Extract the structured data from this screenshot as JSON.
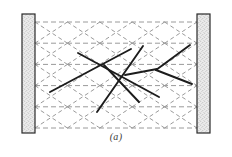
{
  "figure": {
    "caption": "(a)",
    "kind": "structural-frame-strut-and-tie-diagram",
    "background_color": "#ffffff"
  },
  "colors": {
    "column_fill": "#e8e8e8",
    "column_stipple": "#6f6f6f",
    "column_border": "#2a2a2a",
    "grid_dashed": "#9a9a9a",
    "strut_solid": "#1c1c1c",
    "caption_text": "#3a3a3a"
  },
  "columns": [
    {
      "name": "left-column",
      "x": 22,
      "y": 14,
      "width": 13,
      "height": 119,
      "fill": "#e8e8e8",
      "stroke": "#2a2a2a",
      "stroke_width": 1.2,
      "hatch": "stipple"
    },
    {
      "name": "right-column",
      "x": 197,
      "y": 14,
      "width": 13,
      "height": 119,
      "fill": "#e8e8e8",
      "stroke": "#2a2a2a",
      "stroke_width": 1.2,
      "hatch": "stipple"
    }
  ],
  "grid": {
    "left": 35,
    "right": 197,
    "top": 22,
    "bottom": 128,
    "rows": 5,
    "row_pitch": 21.2,
    "cols": 5,
    "col_pitch": 32.4,
    "horizontal_lines_y": [
      22,
      43.2,
      64.4,
      85.6,
      106.8,
      128
    ],
    "dash_pattern": "5 3",
    "diagonal_dash_pattern": "4 3",
    "stroke": "#9a9a9a",
    "stroke_width": 1.0,
    "show_diagonals": true
  },
  "struts": [
    {
      "name": "strut-1",
      "x1": 50,
      "y1": 92,
      "x2": 131,
      "y2": 49,
      "width": 1.9
    },
    {
      "name": "strut-2",
      "x1": 78,
      "y1": 53,
      "x2": 159,
      "y2": 97,
      "width": 1.9
    },
    {
      "name": "strut-3",
      "x1": 97,
      "y1": 112,
      "x2": 143,
      "y2": 46,
      "width": 1.9
    },
    {
      "name": "strut-4",
      "x1": 104,
      "y1": 65,
      "x2": 139,
      "y2": 102,
      "width": 1.9
    },
    {
      "name": "strut-5",
      "x1": 156,
      "y1": 70,
      "x2": 190,
      "y2": 45,
      "width": 1.9
    },
    {
      "name": "strut-6",
      "x1": 156,
      "y1": 70,
      "x2": 192,
      "y2": 84,
      "width": 1.9
    },
    {
      "name": "strut-7",
      "x1": 125,
      "y1": 75,
      "x2": 157,
      "y2": 69,
      "width": 1.9
    }
  ],
  "nodes": [
    {
      "name": "node-left",
      "x": 82,
      "y": 74
    },
    {
      "name": "node-center",
      "x": 118,
      "y": 90
    },
    {
      "name": "node-right",
      "x": 156,
      "y": 70
    }
  ]
}
